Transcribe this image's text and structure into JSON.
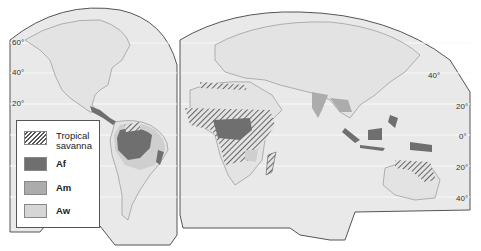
{
  "map": {
    "type": "interrupted world map (Goode homolosine style)",
    "subject": "Tropical climate regions",
    "colors": {
      "ocean_bg": "#ffffff",
      "land": "#e3e3e3",
      "map_panel": "#e9e9e9",
      "graticule": "#f8f8f8",
      "outline": "#555555",
      "Af": "#6f6f6f",
      "Am": "#acacac",
      "Aw": "#cfcfcf",
      "savanna_hatch": "#444444"
    },
    "latitude_labels_left": [
      "60°",
      "40°",
      "20°"
    ],
    "latitude_labels_right": [
      "40°",
      "20°",
      "0°",
      "20°",
      "40°"
    ]
  },
  "legend": {
    "items": [
      {
        "key": "savanna",
        "label_line1": "Tropical",
        "label_line2": "savanna"
      },
      {
        "key": "Af",
        "label": "Af"
      },
      {
        "key": "Am",
        "label": "Am"
      },
      {
        "key": "Aw",
        "label": "Aw"
      }
    ]
  }
}
